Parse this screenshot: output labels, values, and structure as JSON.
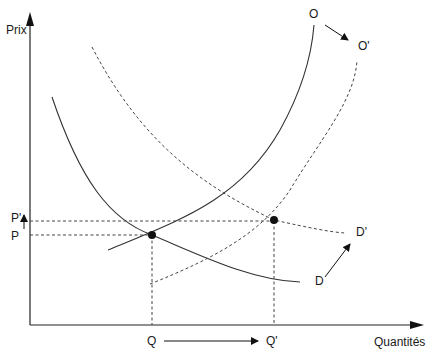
{
  "diagram": {
    "axes": {
      "y_label": "Prix",
      "x_label": "Quantités"
    },
    "curves": {
      "supply": "O",
      "supply_shifted": "O'",
      "demand": "D",
      "demand_shifted": "D'"
    },
    "price_labels": {
      "initial": "P",
      "new": "P'"
    },
    "quantity_labels": {
      "initial": "Q",
      "new": "Q'"
    },
    "equilibria": [
      {
        "name": "initial",
        "price": "P",
        "quantity": "Q"
      },
      {
        "name": "new",
        "price": "P'",
        "quantity": "Q'"
      }
    ],
    "colors": {
      "line": "#333333",
      "dot": "#111111",
      "background": "#ffffff"
    }
  }
}
